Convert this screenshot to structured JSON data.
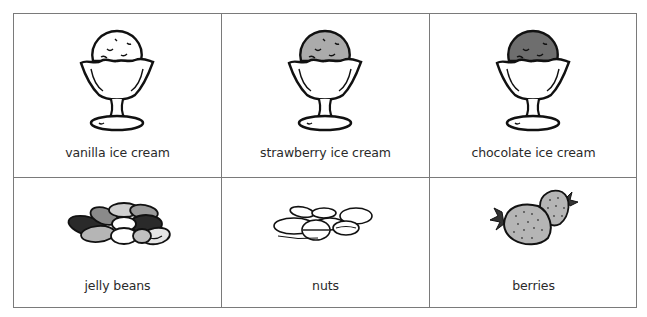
{
  "items": [
    {
      "label": "vanilla ice cream",
      "icon": "vanilla-sundae-icon",
      "fill": "#ffffff"
    },
    {
      "label": "strawberry ice cream",
      "icon": "strawberry-sundae-icon",
      "fill": "#ababab"
    },
    {
      "label": "chocolate ice cream",
      "icon": "chocolate-sundae-icon",
      "fill": "#6e6e6e"
    },
    {
      "label": "jelly beans",
      "icon": "jelly-beans-icon"
    },
    {
      "label": "nuts",
      "icon": "nuts-icon"
    },
    {
      "label": "berries",
      "icon": "strawberries-icon",
      "fill": "#b5b5b5",
      "leaf": "#333333"
    }
  ],
  "colors": {
    "border": "#7a7a7a",
    "text": "#2a2a2a",
    "outline": "#111111"
  }
}
